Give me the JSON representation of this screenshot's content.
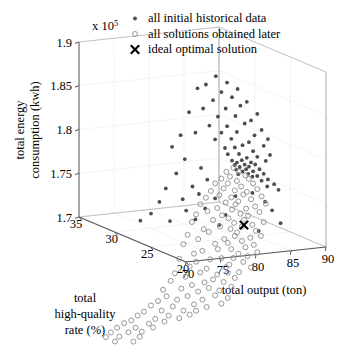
{
  "figure": {
    "exponent_label": "x 10",
    "exponent_power": "5",
    "y_axis_title_line1": "total energy",
    "y_axis_title_line2": "consumption (kwh)",
    "x_axis_title": "total output (ton)",
    "z_axis_title_line1": "total",
    "z_axis_title_line2": "high-quality",
    "z_axis_title_line3": "rate (%)"
  },
  "legend": {
    "items": [
      {
        "label": "all initial historical data",
        "marker": "filled-dot",
        "color": "#4d4d4d"
      },
      {
        "label": "all solutions obtained later",
        "marker": "open-circle",
        "color": "#8c8c8c"
      },
      {
        "label": "ideal optimal solution",
        "marker": "cross",
        "color": "#000000"
      }
    ]
  },
  "chart_data": {
    "type": "scatter",
    "projection": "3d",
    "title": "",
    "xlabel": "total output (ton)",
    "ylabel": "total energy consumption (kwh)",
    "zlabel": "total high-quality rate (%)",
    "y_scale_factor": 100000,
    "xlim": [
      70,
      90
    ],
    "ylim": [
      1.7,
      1.9
    ],
    "zlim": [
      20,
      35
    ],
    "xticks": [
      70,
      75,
      80,
      85,
      90
    ],
    "yticks": [
      1.7,
      1.75,
      1.8,
      1.85,
      1.9
    ],
    "zticks": [
      35,
      30,
      25,
      20
    ],
    "grid": true,
    "legend_position": "top-right",
    "series": [
      {
        "name": "all initial historical data",
        "marker": "filled-dot",
        "color": "#4d4d4d",
        "points": [
          [
            82.0,
            1.876,
            27.6
          ],
          [
            83.2,
            1.869,
            27.2
          ],
          [
            81.0,
            1.866,
            28.0
          ],
          [
            84.1,
            1.863,
            26.6
          ],
          [
            82.6,
            1.858,
            27.4
          ],
          [
            80.2,
            1.861,
            28.4
          ],
          [
            83.6,
            1.853,
            26.9
          ],
          [
            85.0,
            1.849,
            26.2
          ],
          [
            81.8,
            1.848,
            27.8
          ],
          [
            84.4,
            1.844,
            26.5
          ],
          [
            82.9,
            1.84,
            27.1
          ],
          [
            86.0,
            1.836,
            25.7
          ],
          [
            80.8,
            1.838,
            28.2
          ],
          [
            83.9,
            1.832,
            26.7
          ],
          [
            85.4,
            1.828,
            26.0
          ],
          [
            82.2,
            1.83,
            27.5
          ],
          [
            84.8,
            1.824,
            26.3
          ],
          [
            79.4,
            1.833,
            28.8
          ],
          [
            83.0,
            1.82,
            27.0
          ],
          [
            86.4,
            1.818,
            25.5
          ],
          [
            81.4,
            1.819,
            27.9
          ],
          [
            84.0,
            1.814,
            26.6
          ],
          [
            85.8,
            1.811,
            25.9
          ],
          [
            82.5,
            1.812,
            27.3
          ],
          [
            87.0,
            1.808,
            25.2
          ],
          [
            80.0,
            1.81,
            28.5
          ],
          [
            83.4,
            1.806,
            26.8
          ],
          [
            85.2,
            1.803,
            26.1
          ],
          [
            86.6,
            1.8,
            25.4
          ],
          [
            81.9,
            1.804,
            27.6
          ],
          [
            84.6,
            1.799,
            26.4
          ],
          [
            78.6,
            1.806,
            29.2
          ],
          [
            83.8,
            1.796,
            26.7
          ],
          [
            85.6,
            1.793,
            25.9
          ],
          [
            82.8,
            1.795,
            27.1
          ],
          [
            87.2,
            1.79,
            25.1
          ],
          [
            84.2,
            1.789,
            26.5
          ],
          [
            86.0,
            1.787,
            25.7
          ],
          [
            83.1,
            1.788,
            27.0
          ],
          [
            85.0,
            1.785,
            26.2
          ],
          [
            86.8,
            1.783,
            25.3
          ],
          [
            84.5,
            1.782,
            26.4
          ],
          [
            83.5,
            1.781,
            26.8
          ],
          [
            85.4,
            1.78,
            26.0
          ],
          [
            84.0,
            1.779,
            26.6
          ],
          [
            85.8,
            1.778,
            25.8
          ],
          [
            84.8,
            1.777,
            26.3
          ],
          [
            83.8,
            1.776,
            26.7
          ],
          [
            85.2,
            1.775,
            26.1
          ],
          [
            84.3,
            1.774,
            26.5
          ],
          [
            86.2,
            1.773,
            25.6
          ],
          [
            84.9,
            1.772,
            26.2
          ],
          [
            83.9,
            1.771,
            26.6
          ],
          [
            85.6,
            1.77,
            25.9
          ],
          [
            84.6,
            1.769,
            26.4
          ],
          [
            86.6,
            1.768,
            25.4
          ],
          [
            85.1,
            1.767,
            26.1
          ],
          [
            84.1,
            1.766,
            26.5
          ],
          [
            86.0,
            1.765,
            25.7
          ],
          [
            85.5,
            1.764,
            25.9
          ],
          [
            87.0,
            1.762,
            25.2
          ],
          [
            86.4,
            1.76,
            25.5
          ],
          [
            87.6,
            1.757,
            24.9
          ],
          [
            86.9,
            1.754,
            25.2
          ],
          [
            88.0,
            1.751,
            24.7
          ],
          [
            77.8,
            1.792,
            29.6
          ],
          [
            79.0,
            1.779,
            29.0
          ],
          [
            80.6,
            1.77,
            28.3
          ],
          [
            78.2,
            1.762,
            29.4
          ],
          [
            81.2,
            1.757,
            28.0
          ],
          [
            79.8,
            1.748,
            28.7
          ],
          [
            77.2,
            1.744,
            29.9
          ],
          [
            80.4,
            1.74,
            28.4
          ],
          [
            82.0,
            1.736,
            27.7
          ],
          [
            78.8,
            1.733,
            29.1
          ],
          [
            76.6,
            1.728,
            30.2
          ],
          [
            81.0,
            1.724,
            28.1
          ],
          [
            79.2,
            1.72,
            29.0
          ],
          [
            83.0,
            1.718,
            27.2
          ],
          [
            75.8,
            1.714,
            30.6
          ],
          [
            80.0,
            1.711,
            28.5
          ],
          [
            77.6,
            1.707,
            29.7
          ],
          [
            84.0,
            1.74,
            26.8
          ],
          [
            85.6,
            1.745,
            26.0
          ],
          [
            86.8,
            1.736,
            25.4
          ],
          [
            87.4,
            1.727,
            25.0
          ],
          [
            88.2,
            1.713,
            24.6
          ],
          [
            82.4,
            1.706,
            27.5
          ],
          [
            74.8,
            1.705,
            31.1
          ],
          [
            86.2,
            1.702,
            25.7
          ]
        ]
      },
      {
        "name": "all solutions obtained later",
        "marker": "open-circle",
        "color": "#8c8c8c",
        "points": [
          [
            83.6,
            1.773,
            26.7
          ],
          [
            84.2,
            1.769,
            26.5
          ],
          [
            82.9,
            1.768,
            27.0
          ],
          [
            84.8,
            1.765,
            26.2
          ],
          [
            83.2,
            1.763,
            26.8
          ],
          [
            85.2,
            1.761,
            26.1
          ],
          [
            82.4,
            1.76,
            27.2
          ],
          [
            84.0,
            1.758,
            26.6
          ],
          [
            85.6,
            1.756,
            25.9
          ],
          [
            83.0,
            1.755,
            26.9
          ],
          [
            81.8,
            1.754,
            27.5
          ],
          [
            84.4,
            1.752,
            26.4
          ],
          [
            86.0,
            1.75,
            25.7
          ],
          [
            82.6,
            1.749,
            27.1
          ],
          [
            83.8,
            1.747,
            26.7
          ],
          [
            85.0,
            1.746,
            26.2
          ],
          [
            81.4,
            1.745,
            27.7
          ],
          [
            84.6,
            1.743,
            26.3
          ],
          [
            86.4,
            1.742,
            25.5
          ],
          [
            82.2,
            1.741,
            27.3
          ],
          [
            83.4,
            1.739,
            26.8
          ],
          [
            85.4,
            1.738,
            26.0
          ],
          [
            80.9,
            1.737,
            27.9
          ],
          [
            84.1,
            1.735,
            26.5
          ],
          [
            86.8,
            1.734,
            25.3
          ],
          [
            82.8,
            1.733,
            27.0
          ],
          [
            83.9,
            1.731,
            26.7
          ],
          [
            85.8,
            1.73,
            25.8
          ],
          [
            80.4,
            1.729,
            28.2
          ],
          [
            84.9,
            1.727,
            26.2
          ],
          [
            82.0,
            1.726,
            27.4
          ],
          [
            83.5,
            1.725,
            26.8
          ],
          [
            86.2,
            1.724,
            25.6
          ],
          [
            81.0,
            1.722,
            27.8
          ],
          [
            84.3,
            1.721,
            26.4
          ],
          [
            85.1,
            1.719,
            26.1
          ],
          [
            82.5,
            1.718,
            27.2
          ],
          [
            80.0,
            1.717,
            28.4
          ],
          [
            83.1,
            1.715,
            26.9
          ],
          [
            84.7,
            1.714,
            26.3
          ],
          [
            86.6,
            1.713,
            25.4
          ],
          [
            81.6,
            1.712,
            27.6
          ],
          [
            83.7,
            1.71,
            26.7
          ],
          [
            85.5,
            1.709,
            25.9
          ],
          [
            79.6,
            1.708,
            28.6
          ],
          [
            84.5,
            1.706,
            26.4
          ],
          [
            82.3,
            1.705,
            27.3
          ],
          [
            83.3,
            1.703,
            26.8
          ],
          [
            85.9,
            1.702,
            25.8
          ],
          [
            80.7,
            1.701,
            28.0
          ],
          [
            84.0,
            1.699,
            26.6
          ],
          [
            81.2,
            1.698,
            27.8
          ],
          [
            86.3,
            1.697,
            25.5
          ],
          [
            83.8,
            1.695,
            26.7
          ],
          [
            85.3,
            1.694,
            26.0
          ],
          [
            79.2,
            1.693,
            28.8
          ],
          [
            82.7,
            1.691,
            27.1
          ],
          [
            84.4,
            1.69,
            26.3
          ],
          [
            80.2,
            1.689,
            28.3
          ],
          [
            83.0,
            1.687,
            26.9
          ],
          [
            85.7,
            1.686,
            25.9
          ],
          [
            81.8,
            1.685,
            27.5
          ],
          [
            84.8,
            1.683,
            26.2
          ],
          [
            78.8,
            1.682,
            29.0
          ],
          [
            83.4,
            1.68,
            26.8
          ],
          [
            82.1,
            1.679,
            27.4
          ],
          [
            86.0,
            1.678,
            25.7
          ],
          [
            80.6,
            1.676,
            28.1
          ],
          [
            84.1,
            1.675,
            26.5
          ],
          [
            85.0,
            1.673,
            26.1
          ],
          [
            79.8,
            1.672,
            28.5
          ],
          [
            83.6,
            1.67,
            26.7
          ],
          [
            82.4,
            1.669,
            27.2
          ],
          [
            81.3,
            1.667,
            27.7
          ],
          [
            84.6,
            1.666,
            26.3
          ],
          [
            78.4,
            1.665,
            29.2
          ],
          [
            80.0,
            1.663,
            28.4
          ],
          [
            83.2,
            1.662,
            26.9
          ],
          [
            85.4,
            1.66,
            26.0
          ],
          [
            82.8,
            1.659,
            27.0
          ],
          [
            79.4,
            1.657,
            28.7
          ],
          [
            81.0,
            1.656,
            27.9
          ],
          [
            84.2,
            1.654,
            26.5
          ],
          [
            83.0,
            1.653,
            26.9
          ],
          [
            80.4,
            1.651,
            28.2
          ],
          [
            82.0,
            1.65,
            27.4
          ],
          [
            78.0,
            1.648,
            29.4
          ],
          [
            83.8,
            1.647,
            26.7
          ],
          [
            79.0,
            1.645,
            28.9
          ],
          [
            81.6,
            1.644,
            27.6
          ],
          [
            82.6,
            1.642,
            27.1
          ],
          [
            80.8,
            1.64,
            28.0
          ],
          [
            77.6,
            1.639,
            29.6
          ],
          [
            83.4,
            1.637,
            26.8
          ],
          [
            79.6,
            1.636,
            28.6
          ],
          [
            81.2,
            1.634,
            27.8
          ],
          [
            82.2,
            1.632,
            27.3
          ],
          [
            78.6,
            1.631,
            29.1
          ],
          [
            80.2,
            1.629,
            28.3
          ],
          [
            76.9,
            1.628,
            30.0
          ],
          [
            81.8,
            1.626,
            27.5
          ],
          [
            83.0,
            1.624,
            26.9
          ],
          [
            79.2,
            1.623,
            28.8
          ],
          [
            77.2,
            1.621,
            29.8
          ],
          [
            80.6,
            1.62,
            28.1
          ],
          [
            78.2,
            1.618,
            29.3
          ],
          [
            82.4,
            1.617,
            27.2
          ],
          [
            76.4,
            1.615,
            30.2
          ],
          [
            79.8,
            1.614,
            28.5
          ],
          [
            81.0,
            1.612,
            27.9
          ],
          [
            77.8,
            1.61,
            29.5
          ],
          [
            75.8,
            1.609,
            30.6
          ],
          [
            80.0,
            1.607,
            28.4
          ],
          [
            78.8,
            1.606,
            29.0
          ],
          [
            76.8,
            1.604,
            30.1
          ],
          [
            79.4,
            1.602,
            28.7
          ],
          [
            75.2,
            1.601,
            31.0
          ],
          [
            77.4,
            1.599,
            29.7
          ],
          [
            78.4,
            1.597,
            29.2
          ],
          [
            74.6,
            1.596,
            31.3
          ],
          [
            76.2,
            1.594,
            30.4
          ],
          [
            77.0,
            1.592,
            29.9
          ],
          [
            74.0,
            1.59,
            31.6
          ],
          [
            75.6,
            1.588,
            30.7
          ],
          [
            73.4,
            1.586,
            32.0
          ],
          [
            76.0,
            1.584,
            30.5
          ],
          [
            74.4,
            1.582,
            31.4
          ],
          [
            72.8,
            1.58,
            32.4
          ],
          [
            75.0,
            1.578,
            31.1
          ],
          [
            73.8,
            1.576,
            31.8
          ],
          [
            72.2,
            1.574,
            32.7
          ],
          [
            74.8,
            1.572,
            31.2
          ],
          [
            73.0,
            1.57,
            32.3
          ],
          [
            71.8,
            1.568,
            33.0
          ],
          [
            74.2,
            1.566,
            31.5
          ],
          [
            72.6,
            1.564,
            32.5
          ]
        ]
      },
      {
        "name": "ideal optimal solution",
        "marker": "cross",
        "color": "#000000",
        "points": [
          [
            84.7,
            1.708,
            26.3
          ]
        ]
      }
    ]
  }
}
